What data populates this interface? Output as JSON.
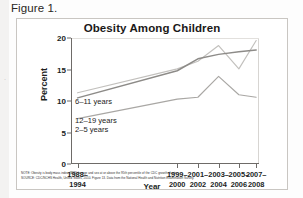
{
  "figure": {
    "label": "Figure 1."
  },
  "chart_data": {
    "type": "line",
    "title": "Obesity Among Children",
    "xlabel": "Year",
    "ylabel": "Percent",
    "ylim": [
      0,
      20
    ],
    "yticks": [
      0,
      5,
      10,
      15,
      20
    ],
    "grid": false,
    "legend": "inline-labels",
    "categories": [
      "1988–1994",
      "1999–2000",
      "2001–2002",
      "2003–2004",
      "2005–2006",
      "2007–2008"
    ],
    "series": [
      {
        "name": "6–11 years",
        "color": "#c2c0bd",
        "values": [
          11.3,
          15.1,
          16.3,
          18.8,
          15.1,
          19.6
        ]
      },
      {
        "name": "12–19 years",
        "color": "#8d8b88",
        "values": [
          10.5,
          14.8,
          16.7,
          17.4,
          17.8,
          18.1
        ]
      },
      {
        "name": "2–5 years",
        "color": "#a9a7a4",
        "values": [
          7.2,
          10.3,
          10.6,
          13.9,
          11.0,
          10.6
        ]
      }
    ]
  },
  "notes": {
    "note": "NOTE: Obesity is body mass index (BMI) for age and sex at or above the 95th percentile of the CDC growth charts.",
    "source": "SOURCE: CDC/NCHS Health, United States, 2010. Figure 13. Data from the National Health and Nutrition Examination Survey."
  },
  "artifacts": {
    "edge_mark": "·"
  }
}
